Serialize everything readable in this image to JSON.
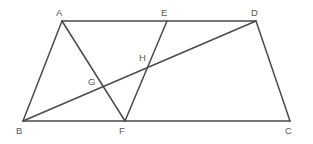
{
  "figure": {
    "background_color": "#ffffff",
    "stroke_color": "#4a4a4a",
    "label_color": "#575757",
    "stroke_width": 1.5,
    "width": 313,
    "height": 144
  },
  "points": {
    "A": {
      "label": "A",
      "x": 62,
      "y": 21,
      "label_x": 56,
      "label_y": 8,
      "type": "vertex"
    },
    "B": {
      "label": "B",
      "x": 23,
      "y": 121,
      "label_x": 16,
      "label_y": 126,
      "type": "vertex"
    },
    "C": {
      "label": "C",
      "x": 290,
      "y": 121,
      "label_x": 285,
      "label_y": 126,
      "type": "vertex"
    },
    "D": {
      "label": "D",
      "x": 256,
      "y": 21,
      "label_x": 251,
      "label_y": 8,
      "type": "vertex"
    },
    "E": {
      "label": "E",
      "x": 167,
      "y": 21,
      "label_x": 161,
      "label_y": 8,
      "type": "point-on-segment"
    },
    "F": {
      "label": "F",
      "x": 125,
      "y": 121,
      "label_x": 119,
      "label_y": 126,
      "type": "point-on-segment"
    },
    "G": {
      "label": "G",
      "x": 101,
      "y": 86,
      "label_x": 88,
      "label_y": 77,
      "type": "intersection"
    },
    "H": {
      "label": "H",
      "x": 148,
      "y": 65,
      "label_x": 139,
      "label_y": 53,
      "type": "intersection"
    }
  },
  "segments": [
    {
      "name": "segment-AD",
      "from": "A",
      "to": "D",
      "x1": 62,
      "y1": 21,
      "x2": 256,
      "y2": 21
    },
    {
      "name": "segment-AB",
      "from": "A",
      "to": "B",
      "x1": 62,
      "y1": 21,
      "x2": 23,
      "y2": 121
    },
    {
      "name": "segment-BC",
      "from": "B",
      "to": "C",
      "x1": 23,
      "y1": 121,
      "x2": 290,
      "y2": 121
    },
    {
      "name": "segment-DC",
      "from": "D",
      "to": "C",
      "x1": 256,
      "y1": 21,
      "x2": 290,
      "y2": 121
    },
    {
      "name": "segment-AF",
      "from": "A",
      "to": "F",
      "x1": 62,
      "y1": 21,
      "x2": 125,
      "y2": 121
    },
    {
      "name": "segment-EF",
      "from": "E",
      "to": "F",
      "x1": 167,
      "y1": 21,
      "x2": 125,
      "y2": 121
    },
    {
      "name": "segment-BD",
      "from": "B",
      "to": "D",
      "x1": 23,
      "y1": 121,
      "x2": 256,
      "y2": 21
    }
  ]
}
